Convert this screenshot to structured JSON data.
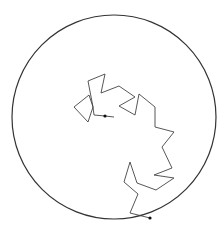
{
  "diagram": {
    "type": "random-walk-in-circle",
    "boundary": {
      "shape": "circle",
      "cx": 114,
      "cy": 117,
      "r": 102,
      "stroke": "#333333"
    },
    "path": {
      "stroke": "#444444",
      "points": [
        [
          114,
          117
        ],
        [
          105,
          116
        ],
        [
          94,
          115
        ],
        [
          93,
          107
        ],
        [
          89,
          95
        ],
        [
          74,
          107
        ],
        [
          88,
          122
        ],
        [
          93,
          107
        ],
        [
          88,
          81
        ],
        [
          105,
          74
        ],
        [
          101,
          93
        ],
        [
          119,
          86
        ],
        [
          135,
          97
        ],
        [
          119,
          106
        ],
        [
          135,
          115
        ],
        [
          139,
          94
        ],
        [
          155,
          107
        ],
        [
          155,
          127
        ],
        [
          174,
          132
        ],
        [
          162,
          147
        ],
        [
          172,
          168
        ],
        [
          154,
          175
        ],
        [
          174,
          178
        ],
        [
          156,
          190
        ],
        [
          137,
          183
        ],
        [
          130,
          162
        ],
        [
          124,
          182
        ],
        [
          138,
          194
        ],
        [
          130,
          213
        ],
        [
          150,
          218
        ]
      ],
      "start_marker": [
        105,
        116
      ],
      "end_marker": [
        150,
        218
      ]
    }
  }
}
